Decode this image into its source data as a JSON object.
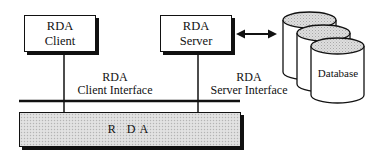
{
  "diagram": {
    "client_box": {
      "line1": "RDA",
      "line2": "Client"
    },
    "server_box": {
      "line1": "RDA",
      "line2": "Server"
    },
    "database": {
      "label": "Database",
      "cylinder_count": 3
    },
    "client_interface": {
      "line1": "RDA",
      "line2": "Client Interface"
    },
    "server_interface": {
      "line1": "RDA",
      "line2": "Server Interface"
    },
    "rda_bar": {
      "label": "R DA"
    },
    "connectors": [
      {
        "from": "RDA Client",
        "to": "RDA bar",
        "type": "line"
      },
      {
        "from": "RDA Server",
        "to": "RDA bar",
        "type": "line"
      },
      {
        "from": "RDA Server",
        "to": "Database",
        "type": "double-arrow"
      }
    ],
    "colors": {
      "stroke": "#111111",
      "fill_shadow": "#111111",
      "cylinder_top": "#d8d8d8",
      "bar_fill": "#dcdcdc",
      "background": "#ffffff"
    }
  }
}
